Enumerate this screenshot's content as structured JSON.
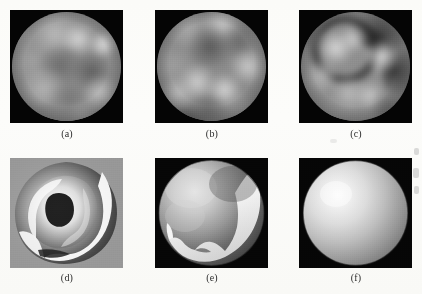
{
  "figure": {
    "type": "image-grid",
    "rows": 2,
    "columns": 3,
    "background_color": "#fdfdfb",
    "panel_background_color": "#050505",
    "caption_color": "#2b2b2b"
  },
  "panels": [
    {
      "id": "a",
      "caption": "(a)",
      "kind": "endoscopic-image",
      "description": "Grayscale endoscopic view with circular field of view on black background; mottled mucosal texture with bright highlights upper-right and darker folds lower-left.",
      "x": 10,
      "y": 10,
      "width": 113,
      "height": 113,
      "fov_shape": "circle",
      "mean_intensity": "#9b9b9b"
    },
    {
      "id": "b",
      "caption": "(b)",
      "kind": "endoscopic-image",
      "description": "Grayscale endoscopic view; dark concentric fold in upper-centre, bright lobes along lower half.",
      "x": 155,
      "y": 10,
      "width": 113,
      "height": 113,
      "fov_shape": "circle",
      "mean_intensity": "#989898"
    },
    {
      "id": "c",
      "caption": "(c)",
      "kind": "endoscopic-image",
      "description": "Grayscale endoscopic view; pronounced dark annular band arcing from upper-right around centre-left, bright mucosal lobes inside the ring.",
      "x": 299,
      "y": 10,
      "width": 113,
      "height": 113,
      "fov_shape": "circle",
      "mean_intensity": "#949494"
    },
    {
      "id": "d",
      "caption": "(d)",
      "kind": "shape-from-shading-reconstruction",
      "description": "Reconstructed depth/needle map on light gray background; spiral ridge with sharp bright-to-dark discontinuity and a dark irregular hole near the centre.",
      "x": 10,
      "y": 158,
      "width": 113,
      "height": 110,
      "fov_shape": "square",
      "background_color": "#9d9d9d"
    },
    {
      "id": "e",
      "caption": "(e)",
      "kind": "shape-from-shading-reconstruction",
      "description": "Reconstructed smooth surface inside a circular field of view; bright crescent hugging the lower-right rim with a jagged inner boundary.",
      "x": 155,
      "y": 158,
      "width": 113,
      "height": 110,
      "fov_shape": "circle",
      "background_color": "#050505"
    },
    {
      "id": "f",
      "caption": "(f)",
      "kind": "shape-from-shading-reconstruction",
      "description": "Reconstructed smooth sphere filling the circular field of view; Lambertian shading with highlight at upper-left falling off to the lower-right rim.",
      "x": 299,
      "y": 158,
      "width": 113,
      "height": 110,
      "fov_shape": "circle",
      "background_color": "#050505"
    }
  ],
  "captions": {
    "a": "(a)",
    "b": "(b)",
    "c": "(c)",
    "d": "(d)",
    "e": "(e)",
    "f": "(f)"
  }
}
